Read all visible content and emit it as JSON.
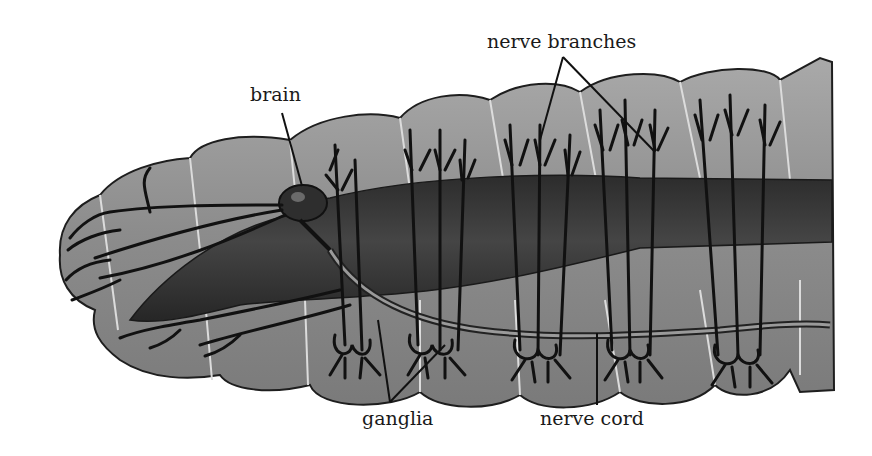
{
  "diagram": {
    "labels": {
      "brain": "brain",
      "nerve_branches": "nerve branches",
      "ganglia": "ganglia",
      "nerve_cord": "nerve cord"
    },
    "colors": {
      "background": "#ffffff",
      "body_fill": "#8a8a8a",
      "body_light": "#a4a4a4",
      "gut": "#3a3a3a",
      "nerve": "#111111",
      "segment_line": "#d8d8d8",
      "leader_line": "#111111",
      "text": "#1a1a1a"
    }
  }
}
